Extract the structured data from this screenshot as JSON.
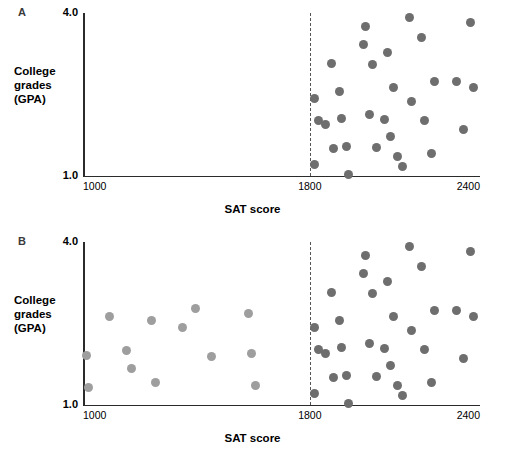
{
  "figure": {
    "x_axis_title": "SAT score",
    "y_axis_title_line1": "College",
    "y_axis_title_line2": "grades",
    "y_axis_title_line3": "(GPA)",
    "x_tick_left": "1000",
    "x_tick_cutoff": "1800",
    "x_tick_right": "2400",
    "y_tick_top": "4.0",
    "y_tick_bottom": "1.0",
    "panel_a_letter": "A",
    "panel_b_letter": "B",
    "colors": {
      "selected_points": "#6e6e6e",
      "unselected_points": "#9e9e9e",
      "axis": "#2b2b2b",
      "cutoff_line": "#555555",
      "background": "#ffffff",
      "panel_letter": "#3a3a3a"
    }
  },
  "chart_data": [
    {
      "type": "scatter",
      "panel": "A",
      "title": "",
      "xlabel": "SAT score",
      "ylabel": "College grades (GPA)",
      "xlim": [
        1000,
        2400
      ],
      "ylim": [
        1.0,
        4.0
      ],
      "xticks": [
        1000,
        1800,
        2400
      ],
      "yticks": [
        1.0,
        4.0
      ],
      "grid": false,
      "legend": "none",
      "annotations": [
        {
          "type": "vline",
          "x": 1800,
          "style": "dashed",
          "label": "1800 admission cutoff"
        }
      ],
      "series": [
        {
          "name": "Admitted students (SAT >= 1800)",
          "color": "#6e6e6e",
          "points": [
            [
              1815,
              2.43
            ],
            [
              1818,
              1.22
            ],
            [
              1832,
              2.02
            ],
            [
              1855,
              1.94
            ],
            [
              1878,
              3.07
            ],
            [
              1885,
              1.5
            ],
            [
              1905,
              2.56
            ],
            [
              1912,
              2.05
            ],
            [
              1928,
              1.55
            ],
            [
              1935,
              1.02
            ],
            [
              1988,
              3.42
            ],
            [
              1995,
              3.75
            ],
            [
              2012,
              2.13
            ],
            [
              2022,
              3.05
            ],
            [
              2035,
              1.52
            ],
            [
              2062,
              2.04
            ],
            [
              2075,
              3.27
            ],
            [
              2085,
              1.72
            ],
            [
              2095,
              2.62
            ],
            [
              2108,
              1.35
            ],
            [
              2128,
              1.18
            ],
            [
              2152,
              3.92
            ],
            [
              2158,
              2.37
            ],
            [
              2192,
              3.55
            ],
            [
              2205,
              2.03
            ],
            [
              2228,
              1.42
            ],
            [
              2238,
              2.74
            ],
            [
              2318,
              2.74
            ],
            [
              2342,
              1.85
            ],
            [
              2368,
              3.82
            ],
            [
              2378,
              2.62
            ]
          ]
        }
      ]
    },
    {
      "type": "scatter",
      "panel": "B",
      "title": "",
      "xlabel": "SAT score",
      "ylabel": "College grades (GPA)",
      "xlim": [
        1000,
        2400
      ],
      "ylim": [
        1.0,
        4.0
      ],
      "xticks": [
        1000,
        1800,
        2400
      ],
      "yticks": [
        1.0,
        4.0
      ],
      "grid": false,
      "legend": "none",
      "annotations": [
        {
          "type": "vline",
          "x": 1800,
          "style": "dashed",
          "label": "1800 admission cutoff"
        }
      ],
      "series": [
        {
          "name": "Admitted students (SAT >= 1800)",
          "color": "#6e6e6e",
          "points": [
            [
              1815,
              2.43
            ],
            [
              1818,
              1.22
            ],
            [
              1832,
              2.02
            ],
            [
              1855,
              1.94
            ],
            [
              1878,
              3.07
            ],
            [
              1885,
              1.5
            ],
            [
              1905,
              2.56
            ],
            [
              1912,
              2.05
            ],
            [
              1928,
              1.55
            ],
            [
              1935,
              1.02
            ],
            [
              1988,
              3.42
            ],
            [
              1995,
              3.75
            ],
            [
              2012,
              2.13
            ],
            [
              2022,
              3.05
            ],
            [
              2035,
              1.52
            ],
            [
              2062,
              2.04
            ],
            [
              2075,
              3.27
            ],
            [
              2085,
              1.72
            ],
            [
              2095,
              2.62
            ],
            [
              2108,
              1.35
            ],
            [
              2128,
              1.18
            ],
            [
              2152,
              3.92
            ],
            [
              2158,
              2.37
            ],
            [
              2192,
              3.55
            ],
            [
              2205,
              2.03
            ],
            [
              2228,
              1.42
            ],
            [
              2238,
              2.74
            ],
            [
              2318,
              2.74
            ],
            [
              2342,
              1.85
            ],
            [
              2368,
              3.82
            ],
            [
              2378,
              2.62
            ]
          ]
        },
        {
          "name": "Rejected students (SAT < 1800)",
          "color": "#9e9e9e",
          "points": [
            [
              1012,
              1.92
            ],
            [
              1018,
              1.32
            ],
            [
              1092,
              2.62
            ],
            [
              1152,
              2.0
            ],
            [
              1172,
              1.68
            ],
            [
              1242,
              2.55
            ],
            [
              1255,
              1.42
            ],
            [
              1352,
              2.43
            ],
            [
              1398,
              2.78
            ],
            [
              1452,
              1.9
            ],
            [
              1585,
              2.68
            ],
            [
              1595,
              1.95
            ],
            [
              1608,
              1.35
            ]
          ]
        }
      ]
    }
  ]
}
